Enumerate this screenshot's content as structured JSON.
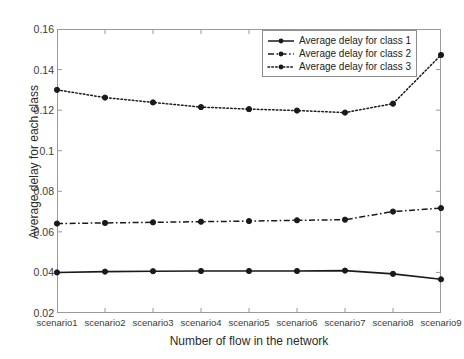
{
  "chart_data": {
    "type": "line",
    "title": "",
    "xlabel": "Number of flow in the network",
    "ylabel": "Average delay for each class",
    "categories": [
      "scenario1",
      "scenario2",
      "scenario3",
      "scenario4",
      "scenario5",
      "scenario6",
      "scenario7",
      "scenario8",
      "scenario9"
    ],
    "ylim": [
      0.02,
      0.16
    ],
    "yticks": [
      0.02,
      0.04,
      0.06,
      0.08,
      0.1,
      0.12,
      0.14,
      0.16
    ],
    "ytick_labels": [
      "0.02",
      "0.04",
      "0.06",
      "0.08",
      "0.1",
      "0.12",
      "0.14",
      "0.16"
    ],
    "grid": false,
    "legend_position": "top-right",
    "series": [
      {
        "name": "Average delay for class 1",
        "style": "solid",
        "marker": "circle",
        "color": "#1a1a1a",
        "values": [
          0.04,
          0.0404,
          0.0406,
          0.0407,
          0.0407,
          0.0407,
          0.0409,
          0.0393,
          0.0366
        ]
      },
      {
        "name": "Average delay for class 2",
        "style": "dash-dot",
        "marker": "circle",
        "color": "#1a1a1a",
        "values": [
          0.0641,
          0.0644,
          0.0647,
          0.065,
          0.0653,
          0.0657,
          0.066,
          0.07,
          0.0717
        ]
      },
      {
        "name": "Average delay for class 3",
        "style": "dotted",
        "marker": "circle",
        "color": "#1a1a1a",
        "values": [
          0.13,
          0.1262,
          0.1238,
          0.1215,
          0.1205,
          0.1198,
          0.1188,
          0.1232,
          0.1472
        ]
      }
    ]
  },
  "legend": {
    "entries": [
      "Average delay for class 1",
      "Average delay for class 2",
      "Average delay for class 3"
    ]
  },
  "axes": {
    "x_title": "Number of flow in the network",
    "y_title": "Average delay for each class"
  }
}
